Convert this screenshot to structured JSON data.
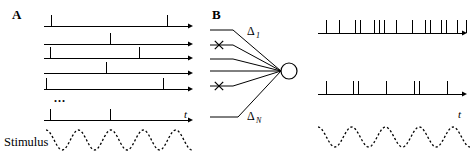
{
  "figure": {
    "width": 475,
    "height": 157,
    "background": "#ffffff",
    "ink_color": "#000000"
  },
  "panels": {
    "a": {
      "letter": "A",
      "letter_pos": {
        "x": 12,
        "y": 19
      },
      "axis_x_start": 44,
      "axis_x_end": 188,
      "arrow_end": 192,
      "time_axis_label": "t",
      "time_axis_label_pos": {
        "x": 184,
        "y": 118
      },
      "stimulus_label": "Stimulus",
      "stimulus_label_pos": {
        "x": 4,
        "y": 146
      },
      "ellipsis_label": "...",
      "ellipsis_pos": {
        "x": 54,
        "y": 102
      },
      "spike_height": 11,
      "rows": [
        {
          "name": "trial-1",
          "baseline_y": 26,
          "spikes": [
            51,
            167
          ]
        },
        {
          "name": "trial-2",
          "baseline_y": 44,
          "spikes": [
            110
          ]
        },
        {
          "name": "trial-3",
          "baseline_y": 58,
          "spikes": [
            50,
            139
          ]
        },
        {
          "name": "trial-4",
          "baseline_y": 73,
          "spikes": [
            106
          ]
        },
        {
          "name": "trial-5",
          "baseline_y": 89,
          "spikes": [
            46,
            163
          ]
        },
        {
          "name": "trial-n",
          "baseline_y": 120,
          "spikes": [
            50,
            110
          ]
        }
      ],
      "stimulus_wave": {
        "x_start": 46,
        "x_end": 192,
        "center_y": 140,
        "amplitude": 10,
        "cycles": 4.5,
        "phase_deg": 90,
        "style": "dashed"
      }
    },
    "b": {
      "letter": "B",
      "letter_pos": {
        "x": 212,
        "y": 19
      },
      "soma": {
        "cx": 289,
        "cy": 71,
        "r": 8
      },
      "dendrite_label_1": "Δ",
      "dendrite_label_1_sub": "1",
      "dendrite_label_1_pos": {
        "x": 247,
        "y": 35
      },
      "dendrite_label_n": "Δ",
      "dendrite_label_n_sub": "N",
      "dendrite_label_n_pos": {
        "x": 247,
        "y": 120
      },
      "inputs": [
        {
          "name": "input-1",
          "x_start": 210,
          "y_start": 30,
          "elbow_x": 233,
          "marked": false
        },
        {
          "name": "input-2",
          "x_start": 210,
          "y_start": 45,
          "elbow_x": 233,
          "marked": true,
          "x_mark": {
            "cx": 219,
            "cy": 45
          }
        },
        {
          "name": "input-3",
          "x_start": 210,
          "y_start": 59,
          "elbow_x": 233,
          "marked": false
        },
        {
          "name": "input-4",
          "x_start": 210,
          "y_start": 71,
          "elbow_x": 233,
          "marked": false
        },
        {
          "name": "input-5",
          "x_start": 210,
          "y_start": 86,
          "elbow_x": 233,
          "marked": true,
          "x_mark": {
            "cx": 219,
            "cy": 86
          }
        },
        {
          "name": "input-6",
          "x_start": 210,
          "y_start": 117,
          "elbow_x": 238,
          "marked": false
        }
      ],
      "axis_x_start": 318,
      "axis_x_end": 462,
      "arrow_end": 466,
      "time_axis_label": "t",
      "time_axis_label_pos": {
        "x": 458,
        "y": 118
      },
      "spike_height": 13,
      "trains": [
        {
          "name": "input-spike-train",
          "baseline_y": 33,
          "spikes": [
            326,
            339,
            355,
            360,
            374,
            379,
            384,
            396,
            412,
            425,
            430,
            441,
            446,
            457,
            466
          ]
        },
        {
          "name": "output-spike-train",
          "baseline_y": 94,
          "spikes": [
            326,
            353,
            358,
            386,
            414,
            419,
            447
          ]
        }
      ],
      "stimulus_wave": {
        "x_start": 318,
        "x_end": 470,
        "center_y": 137,
        "amplitude": 10,
        "cycles": 4.5,
        "phase_deg": 90,
        "style": "dashed"
      }
    }
  }
}
